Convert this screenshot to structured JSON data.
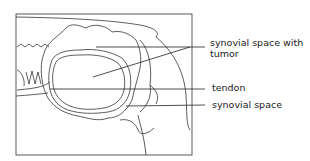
{
  "diagram": {
    "labels": [
      {
        "id": "synovial-space-tumor",
        "lines": [
          "synovial space with",
          "tumor"
        ]
      },
      {
        "id": "tendon",
        "lines": [
          "tendon"
        ]
      },
      {
        "id": "synovial-space",
        "lines": [
          "synovial space"
        ]
      }
    ]
  }
}
